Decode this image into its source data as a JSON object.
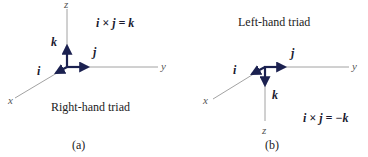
{
  "colors": {
    "axis": "#8a8a8a",
    "vector": "#1b2150",
    "text": "#222222"
  },
  "panels": [
    {
      "id": "a",
      "caption": "(a)",
      "title": "Right-hand triad",
      "equation": "i × j = k",
      "axes": {
        "x": "x",
        "y": "y",
        "z": "z"
      },
      "vectors": {
        "i": "i",
        "j": "j",
        "k": "k"
      }
    },
    {
      "id": "b",
      "caption": "(b)",
      "title": "Left-hand triad",
      "equation": "i × j = −k",
      "axes": {
        "x": "x",
        "y": "y",
        "z": "z"
      },
      "vectors": {
        "i": "i",
        "j": "j",
        "k": "k"
      }
    }
  ]
}
